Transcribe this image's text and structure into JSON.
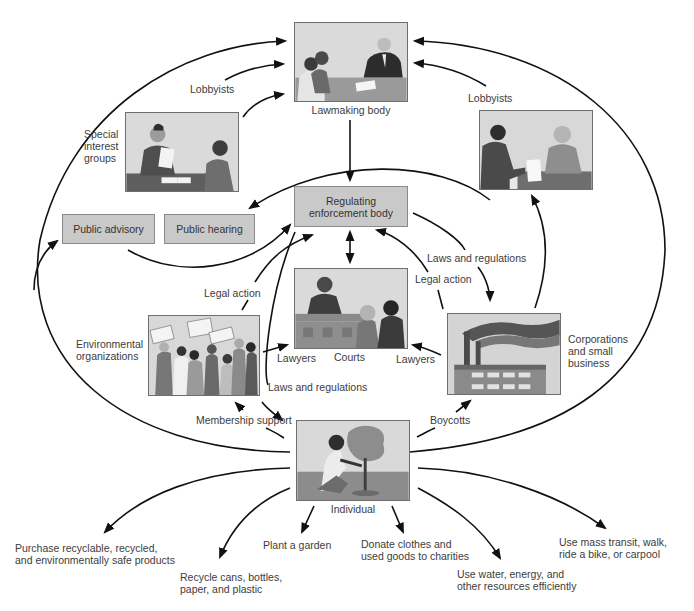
{
  "diagram": {
    "nodes": {
      "lawmaking_body": {
        "label": "Lawmaking body"
      },
      "special_interest_groups": {
        "label_lines": [
          "Special",
          "interest",
          "groups"
        ]
      },
      "lobbyists_left": {
        "label": "Lobbyists"
      },
      "lobbyists_right": {
        "label": "Lobbyists"
      },
      "regulating_body": {
        "label_lines": [
          "Regulating",
          "enforcement body"
        ]
      },
      "public_advisory": {
        "label": "Public advisory"
      },
      "public_hearing": {
        "label": "Public hearing"
      },
      "courts": {
        "label": "Courts"
      },
      "environmental_organizations": {
        "label_lines": [
          "Environmental",
          "organizations"
        ]
      },
      "corporations": {
        "label_lines": [
          "Corporations",
          "and small",
          "business"
        ]
      },
      "individual": {
        "label": "Individual"
      }
    },
    "edge_labels": {
      "legal_action_left": "Legal action",
      "legal_action_right": "Legal action",
      "laws_regs_right": "Laws and regulations",
      "laws_regs_center": "Laws and regulations",
      "lawyers_left": "Lawyers",
      "lawyers_right": "Lawyers",
      "membership_support": "Membership support",
      "boycotts": "Boycotts"
    },
    "individual_actions": [
      {
        "lines": [
          "Purchase recyclable, recycled,",
          "and environmentally safe products"
        ]
      },
      {
        "lines": [
          "Recycle cans, bottles,",
          "paper, and plastic"
        ]
      },
      {
        "lines": [
          "Plant a garden"
        ]
      },
      {
        "lines": [
          "Donate clothes and",
          "used goods to charities"
        ]
      },
      {
        "lines": [
          "Use water, energy, and",
          "other resources efficiently"
        ]
      },
      {
        "lines": [
          "Use mass transit, walk,",
          "ride a bike, or carpool"
        ]
      }
    ],
    "colors": {
      "box_fill": "#c9c9c9",
      "box_border": "#8a8a8a",
      "arrow": "#111111",
      "text": "#3c3c3c"
    }
  }
}
